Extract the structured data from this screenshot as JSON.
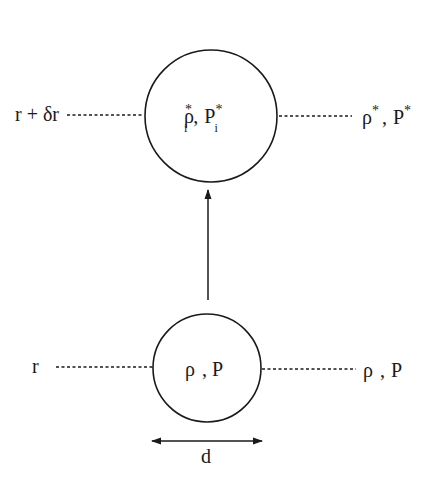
{
  "diagram": {
    "colors": {
      "stroke": "#1a1a1a",
      "background": "#ffffff"
    },
    "upper_level": {
      "radius_label": "r + δr",
      "bubble_label": {
        "rho": "ρ",
        "rho_sub": "i",
        "rho_sup": "*",
        "sep": ",",
        "p": "P",
        "p_sub": "i",
        "p_sup": "*"
      },
      "ambient_label": {
        "rho": "ρ",
        "rho_sup": "*",
        "sep": ",",
        "p": "P",
        "p_sup": "*"
      }
    },
    "lower_level": {
      "radius_label": "r",
      "bubble_label": {
        "rho": "ρ",
        "sep": ",",
        "p": "P"
      },
      "ambient_label": {
        "rho": "ρ",
        "sep": ",",
        "p": "P"
      }
    },
    "diameter_label": "d"
  }
}
